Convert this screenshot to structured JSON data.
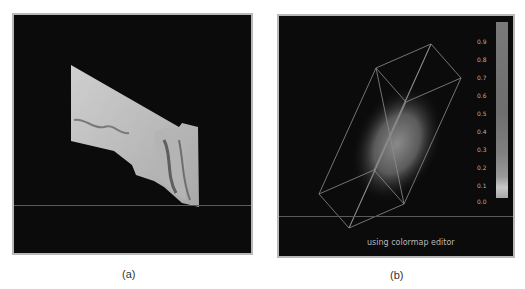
{
  "figure": {
    "panels": [
      {
        "id": "a",
        "caption": "(a)",
        "description": "3D rendered isosurface (grey shaded surface)"
      },
      {
        "id": "b",
        "caption": "(b)",
        "description": "Volume rendering inside wireframe box with colorbar",
        "annotation": "using colormap editor"
      }
    ],
    "colorbar": {
      "ticks": [
        "0.9",
        "0.8",
        "0.7",
        "0.6",
        "0.5",
        "0.4",
        "0.3",
        "0.2",
        "0.1",
        "0.0"
      ],
      "min": 0.0,
      "max": 0.9
    },
    "colors": {
      "background": "#0b0b0b",
      "frame": "#b8b8b8",
      "surface": "#c4c4c4",
      "wireframe": "#9a9a9a"
    }
  }
}
